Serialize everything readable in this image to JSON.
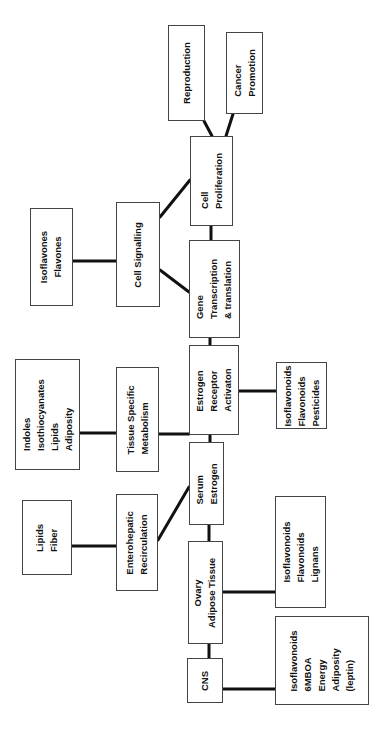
{
  "diagram": {
    "nodes": {
      "reproduction": "Reproduction",
      "cancer_promotion": "Cancer\nPromotion",
      "cell_proliferation": "Cell\nProliferation",
      "cell_signalling": "Cell Signalling",
      "isoflavones_flavones": "Isoflavones\nFlavones",
      "gene_transcription": "Gene\nTranscription\n& translation",
      "estrogen_receptor": "Estrogen\nReceptor\nActivaton",
      "tissue_metabolism": "Tissue Specific\nMetabolism",
      "indoles_group": "Indoles\nIsothiocyanates\nLipids\nAdiposity",
      "er_modulators": "Isoflavonoids\nFlavonoids\nPesticides",
      "serum_estrogen": "Serum\nEstrogen",
      "enterohepatic": "Enterohepatic\nRecirculation",
      "lipids_fiber": "Lipids\nFiber",
      "ovary_adipose": "Ovary\nAdipose Tissue",
      "ovary_modulators": "Isoflavonoids\nFlavonoids\nLignans",
      "cns": "CNS",
      "cns_modulators": "Isoflavonoids\n6MBOA\nEnergy\nAdiposity\n(leptin)"
    },
    "edges": [
      [
        "cell_proliferation",
        "reproduction"
      ],
      [
        "cell_proliferation",
        "cancer_promotion"
      ],
      [
        "cell_signalling",
        "cell_proliferation"
      ],
      [
        "cell_signalling",
        "gene_transcription"
      ],
      [
        "isoflavones_flavones",
        "cell_signalling"
      ],
      [
        "gene_transcription",
        "cell_proliferation"
      ],
      [
        "estrogen_receptor",
        "gene_transcription"
      ],
      [
        "tissue_metabolism",
        "estrogen_receptor"
      ],
      [
        "indoles_group",
        "tissue_metabolism"
      ],
      [
        "er_modulators",
        "estrogen_receptor"
      ],
      [
        "serum_estrogen",
        "estrogen_receptor"
      ],
      [
        "enterohepatic",
        "serum_estrogen"
      ],
      [
        "lipids_fiber",
        "enterohepatic"
      ],
      [
        "ovary_adipose",
        "serum_estrogen"
      ],
      [
        "ovary_modulators",
        "ovary_adipose"
      ],
      [
        "cns",
        "ovary_adipose"
      ],
      [
        "cns_modulators",
        "cns"
      ]
    ]
  }
}
